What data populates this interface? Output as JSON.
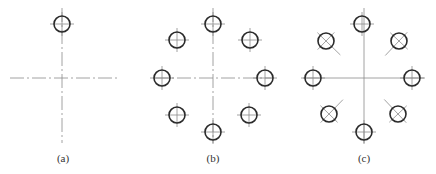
{
  "figure": {
    "colors": {
      "stroke": "#2a2a2a",
      "centerline": "#8a8a8a",
      "background": "#ffffff"
    },
    "panels": [
      {
        "id": "a",
        "label": "(a)",
        "center": [
          62,
          78
        ],
        "pitch_radius": 54,
        "centerline_style": "dash-dot",
        "h_line": [
          10,
          117
        ],
        "v_line": [
          8,
          143
        ],
        "holes": [
          {
            "x": 62,
            "y": 24,
            "r": 8,
            "cross": "orthogonal"
          }
        ],
        "label_pos": [
          63,
          152
        ]
      },
      {
        "id": "b",
        "label": "(b)",
        "center": [
          213,
          78
        ],
        "pitch_radius": 54,
        "centerline_style": "dash-dot",
        "h_line": [
          155,
          272
        ],
        "v_line": [
          8,
          143
        ],
        "holes": [
          {
            "x": 213,
            "y": 24,
            "r": 8,
            "cross": "orthogonal"
          },
          {
            "x": 250,
            "y": 40,
            "r": 8,
            "cross": "orthogonal"
          },
          {
            "x": 265,
            "y": 78,
            "r": 8,
            "cross": "orthogonal"
          },
          {
            "x": 249,
            "y": 115,
            "r": 8,
            "cross": "orthogonal"
          },
          {
            "x": 213,
            "y": 132,
            "r": 8,
            "cross": "orthogonal"
          },
          {
            "x": 177,
            "y": 115,
            "r": 8,
            "cross": "orthogonal"
          },
          {
            "x": 162,
            "y": 78,
            "r": 8,
            "cross": "orthogonal"
          },
          {
            "x": 177,
            "y": 40,
            "r": 8,
            "cross": "orthogonal"
          }
        ],
        "label_pos": [
          213,
          152
        ]
      },
      {
        "id": "c",
        "label": "(c)",
        "center": [
          364,
          78
        ],
        "pitch_radius": 52,
        "centerline_style": "solid",
        "h_line": [
          303,
          425
        ],
        "v_line": [
          8,
          143
        ],
        "holes": [
          {
            "x": 362,
            "y": 24,
            "r": 8,
            "cross": "orthogonal"
          },
          {
            "x": 399,
            "y": 41,
            "r": 8,
            "cross": "radial"
          },
          {
            "x": 412,
            "y": 78,
            "r": 8,
            "cross": "orthogonal"
          },
          {
            "x": 398,
            "y": 114,
            "r": 8,
            "cross": "radial"
          },
          {
            "x": 364,
            "y": 132,
            "r": 8,
            "cross": "orthogonal"
          },
          {
            "x": 329,
            "y": 114,
            "r": 8,
            "cross": "radial"
          },
          {
            "x": 313,
            "y": 78,
            "r": 8,
            "cross": "orthogonal"
          },
          {
            "x": 326,
            "y": 41,
            "r": 8,
            "cross": "radial"
          }
        ],
        "label_pos": [
          364,
          152
        ]
      }
    ]
  }
}
